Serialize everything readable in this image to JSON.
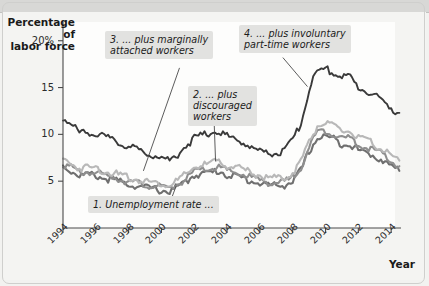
{
  "figure": {
    "y_axis_title": "Percentage of\nlabor force",
    "x_axis_title": "Year"
  },
  "annotations": [
    {
      "id": "annot1",
      "text": "1. Unemployment rate ..."
    },
    {
      "id": "annot2",
      "text": "2. ... plus\ndiscouraged\nworkers"
    },
    {
      "id": "annot3",
      "text": "3. ... plus marginally\nattached workers"
    },
    {
      "id": "annot4",
      "text": "4. ... plus involuntary\npart-time workers"
    }
  ],
  "colors": {
    "series1": "#6f6f6f",
    "series2": "#8e8e8e",
    "series3": "#b8b8b8",
    "series4": "#3a3a3a",
    "axis": "#4a4a4a",
    "annotation_bg": "#e2e2e0",
    "plot_bg": "#fdfdfc",
    "page_bg": "#f4f4f2"
  },
  "chart_data": {
    "type": "line",
    "title": "",
    "xlabel": "Year",
    "ylabel": "Percentage of labor force",
    "xlim": [
      1994,
      2014.6
    ],
    "ylim": [
      0,
      22
    ],
    "yticks": [
      5,
      10,
      15,
      20
    ],
    "ytick_labels": [
      "5",
      "10",
      "15",
      "20%"
    ],
    "xticks": [
      1994,
      1996,
      1998,
      2000,
      2002,
      2004,
      2006,
      2008,
      2010,
      2012,
      2014
    ],
    "xtick_labels": [
      "1994",
      "1996",
      "1998",
      "2000",
      "2002",
      "2004",
      "2006",
      "2008",
      "2010",
      "2012",
      "2014"
    ],
    "grid": false,
    "legend": "none (inline callout annotations)",
    "x": [
      1994.0,
      1994.5,
      1995.0,
      1995.5,
      1996.0,
      1996.5,
      1997.0,
      1997.5,
      1998.0,
      1998.5,
      1999.0,
      1999.5,
      2000.0,
      2000.5,
      2001.0,
      2001.5,
      2002.0,
      2002.5,
      2003.0,
      2003.5,
      2004.0,
      2004.5,
      2005.0,
      2005.5,
      2006.0,
      2006.5,
      2007.0,
      2007.5,
      2008.0,
      2008.5,
      2009.0,
      2009.5,
      2010.0,
      2010.5,
      2011.0,
      2011.5,
      2012.0,
      2012.5,
      2013.0,
      2013.5,
      2014.0,
      2014.5
    ],
    "series": [
      {
        "name": "1. Unemployment rate (U-3)",
        "color": "#6f6f6f",
        "values": [
          6.6,
          6.1,
          5.6,
          5.7,
          5.6,
          5.3,
          5.2,
          4.9,
          4.7,
          4.5,
          4.3,
          4.2,
          4.0,
          3.9,
          4.4,
          4.9,
          5.7,
          5.8,
          5.9,
          6.1,
          5.7,
          5.5,
          5.3,
          5.0,
          4.8,
          4.6,
          4.5,
          4.6,
          5.0,
          6.1,
          8.2,
          9.6,
          9.8,
          9.5,
          9.0,
          9.0,
          8.3,
          8.0,
          7.7,
          7.2,
          6.6,
          6.1
        ]
      },
      {
        "name": "2. ... plus discouraged workers",
        "color": "#8e8e8e",
        "values": [
          6.9,
          6.4,
          5.9,
          6.0,
          5.9,
          5.6,
          5.5,
          5.2,
          5.0,
          4.8,
          4.6,
          4.5,
          4.3,
          4.2,
          4.7,
          5.2,
          6.0,
          6.2,
          6.3,
          6.5,
          6.1,
          5.9,
          5.7,
          5.4,
          5.1,
          4.9,
          4.8,
          4.9,
          5.4,
          6.5,
          8.7,
          10.2,
          10.4,
          10.1,
          9.6,
          9.6,
          8.9,
          8.6,
          8.3,
          7.8,
          7.1,
          6.6
        ]
      },
      {
        "name": "3. ... plus marginally attached workers",
        "color": "#b8b8b8",
        "values": [
          7.3,
          6.9,
          6.4,
          6.5,
          6.4,
          6.1,
          5.9,
          5.6,
          5.4,
          5.2,
          5.0,
          4.9,
          4.7,
          4.6,
          5.1,
          5.7,
          6.5,
          6.7,
          6.9,
          7.1,
          6.7,
          6.5,
          6.2,
          5.9,
          5.6,
          5.4,
          5.3,
          5.4,
          5.9,
          7.1,
          9.3,
          10.9,
          11.2,
          10.8,
          10.4,
          10.3,
          9.6,
          9.3,
          8.9,
          8.4,
          7.7,
          7.2
        ]
      },
      {
        "name": "4. ... plus involuntary part-time workers (U-6)",
        "color": "#3a3a3a",
        "values": [
          11.8,
          11.0,
          10.2,
          10.3,
          10.1,
          9.7,
          9.4,
          9.0,
          8.7,
          8.4,
          8.0,
          7.8,
          7.5,
          7.2,
          7.9,
          8.8,
          9.6,
          9.9,
          10.2,
          10.4,
          9.8,
          9.5,
          9.1,
          8.6,
          8.2,
          8.0,
          8.0,
          8.3,
          9.3,
          11.2,
          14.8,
          16.8,
          17.0,
          16.6,
          16.1,
          16.2,
          15.0,
          14.6,
          14.2,
          13.5,
          12.8,
          12.3
        ]
      }
    ],
    "leaders": [
      {
        "annotation": "1",
        "from": [
          2000.6,
          3.1
        ],
        "to": [
          2000.9,
          4.5
        ]
      },
      {
        "annotation": "2",
        "from": [
          2003.2,
          11.9
        ],
        "to": [
          2003.3,
          7.1
        ]
      },
      {
        "annotation": "3",
        "from": [
          2001.1,
          17.1
        ],
        "to": [
          1998.9,
          6.1
        ]
      },
      {
        "annotation": "4",
        "from": [
          2007.4,
          18.2
        ],
        "to": [
          2008.9,
          15.1
        ]
      }
    ]
  }
}
